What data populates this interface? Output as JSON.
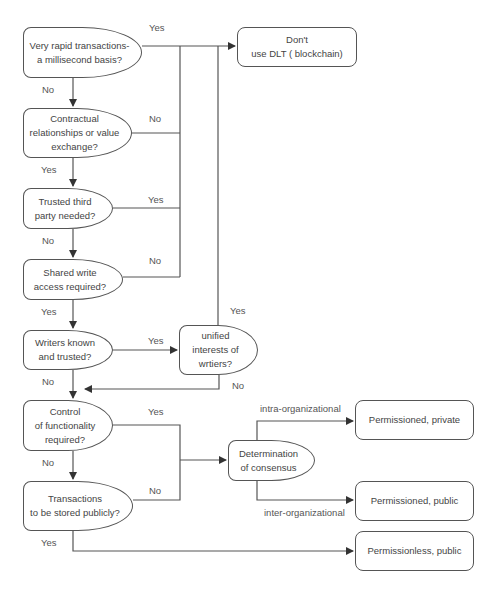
{
  "diagram": {
    "type": "flowchart",
    "decisions": [
      {
        "id": "rapid",
        "text": "Very rapid transactions-\na millisecond basis?"
      },
      {
        "id": "contract",
        "text": "Contractual\nrelationships or value\nexchange?"
      },
      {
        "id": "third",
        "text": "Trusted third\nparty needed?"
      },
      {
        "id": "shared",
        "text": "Shared write\naccess required?"
      },
      {
        "id": "writers",
        "text": "Writers known\nand trusted?"
      },
      {
        "id": "unified",
        "text": "unified\ninterests of\nwrtiers?"
      },
      {
        "id": "control",
        "text": "Control\nof functionality\nrequired?"
      },
      {
        "id": "publicly",
        "text": "Transactions\nto be stored publicly?"
      },
      {
        "id": "consensus",
        "text": "Determination\nof consensus"
      }
    ],
    "outcomes": [
      {
        "id": "dont",
        "text": "Don't\nuse DLT ( blockchain)"
      },
      {
        "id": "perm_private",
        "text": "Permissioned,  private"
      },
      {
        "id": "perm_public",
        "text": "Permissioned,  public"
      },
      {
        "id": "permless_public",
        "text": "Permissionless,  public"
      }
    ],
    "edge_labels": {
      "rapid_yes": "Yes",
      "rapid_no": "No",
      "contract_no": "No",
      "contract_yes": "Yes",
      "third_yes": "Yes",
      "third_no": "No",
      "shared_no": "No",
      "shared_yes": "Yes",
      "writers_yes": "Yes",
      "writers_no": "No",
      "unified_yes": "Yes",
      "unified_no": "No",
      "control_yes": "Yes",
      "control_no": "No",
      "publicly_no": "No",
      "publicly_yes": "Yes",
      "intra": "intra-organizational",
      "inter": "inter-organizational"
    },
    "colors": {
      "stroke": "#555555",
      "text": "#444444",
      "background": "#ffffff"
    }
  }
}
